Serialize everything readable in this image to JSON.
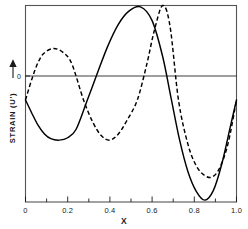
{
  "chart_data": {
    "type": "line",
    "title": "",
    "xlabel": "X",
    "ylabel": "STRAIN  (U')",
    "ylabel_arrow": "up-arrow",
    "y_zero_label": "0",
    "xlim": [
      0,
      1.0
    ],
    "ylim": [
      -1.08,
      1.0
    ],
    "grid": false,
    "legend": "none",
    "x_ticks_major": [
      "0",
      "0.2",
      "0.4",
      "0.6",
      "0.8",
      "1.0"
    ],
    "x_tick_major_values": [
      0,
      0.2,
      0.4,
      0.6,
      0.8,
      1.0
    ],
    "x_tick_minor_values": [
      0.1,
      0.3,
      0.5,
      0.7,
      0.9
    ],
    "y_ticks": [
      "0"
    ],
    "y_tick_values": [
      0
    ],
    "series": [
      {
        "name": "solid-curve",
        "style": "solid",
        "color": "#000000",
        "x": [
          0.0,
          0.03,
          0.06,
          0.09,
          0.12,
          0.16,
          0.2,
          0.24,
          0.29,
          0.34,
          0.39,
          0.44,
          0.49,
          0.545,
          0.6,
          0.65,
          0.69,
          0.73,
          0.77,
          0.81,
          0.85,
          0.89,
          0.93,
          0.97,
          1.0
        ],
        "y": [
          0.0,
          -0.14,
          -0.27,
          -0.36,
          -0.41,
          -0.425,
          -0.4,
          -0.31,
          -0.02,
          0.28,
          0.57,
          0.8,
          0.94,
          0.985,
          0.84,
          0.46,
          0.02,
          -0.42,
          -0.76,
          -0.97,
          -1.06,
          -0.96,
          -0.68,
          -0.29,
          0.0
        ]
      },
      {
        "name": "dashed-curve",
        "style": "dashed",
        "color": "#000000",
        "x": [
          0.0,
          0.03,
          0.06,
          0.09,
          0.135,
          0.18,
          0.22,
          0.275,
          0.32,
          0.36,
          0.4,
          0.44,
          0.48,
          0.53,
          0.575,
          0.61,
          0.65,
          0.685,
          0.725,
          0.77,
          0.81,
          0.85,
          0.885,
          0.92,
          0.96,
          1.0
        ],
        "y": [
          0.0,
          0.22,
          0.4,
          0.5,
          0.545,
          0.5,
          0.38,
          0.0,
          -0.24,
          -0.38,
          -0.425,
          -0.36,
          -0.22,
          0.0,
          0.38,
          0.73,
          1.0,
          0.78,
          0.0,
          -0.47,
          -0.7,
          -0.8,
          -0.815,
          -0.72,
          -0.46,
          0.0
        ]
      }
    ]
  },
  "axes": {
    "x_axis_title": "X",
    "y_axis_title": "STRAIN  (U')",
    "y_zero_marker": "0"
  },
  "x_tick_labels": [
    {
      "value": 0,
      "text": "0"
    },
    {
      "value": 0.2,
      "text": "0.2"
    },
    {
      "value": 0.4,
      "text": "0.4"
    },
    {
      "value": 0.6,
      "text": "0.6"
    },
    {
      "value": 0.8,
      "text": "0.8"
    },
    {
      "value": 1.0,
      "text": "1.0"
    }
  ]
}
